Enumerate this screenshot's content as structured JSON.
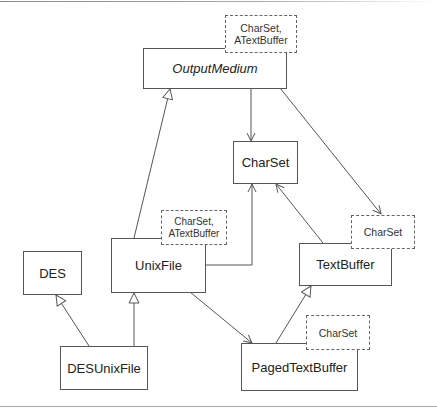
{
  "diagram": {
    "type": "UML class diagram",
    "classes": [
      {
        "id": "output_medium",
        "name": "OutputMedium",
        "abstract": true,
        "template_params": "CharSet,\nATextBuffer"
      },
      {
        "id": "charset",
        "name": "CharSet",
        "abstract": false
      },
      {
        "id": "unix_file",
        "name": "UnixFile",
        "abstract": false,
        "template_params": "CharSet,\nATextBuffer"
      },
      {
        "id": "text_buffer",
        "name": "TextBuffer",
        "abstract": false,
        "template_params": "CharSet"
      },
      {
        "id": "des",
        "name": "DES",
        "abstract": false
      },
      {
        "id": "des_unix_file",
        "name": "DESUnixFile",
        "abstract": false
      },
      {
        "id": "paged_text_buffer",
        "name": "PagedTextBuffer",
        "abstract": false,
        "template_params": "CharSet"
      }
    ],
    "relationships": [
      {
        "from": "UnixFile",
        "to": "OutputMedium",
        "kind": "generalization"
      },
      {
        "from": "OutputMedium",
        "to": "CharSet",
        "kind": "dependency"
      },
      {
        "from": "OutputMedium",
        "to": "TextBuffer",
        "kind": "dependency"
      },
      {
        "from": "UnixFile",
        "to": "CharSet",
        "kind": "dependency"
      },
      {
        "from": "TextBuffer",
        "to": "CharSet",
        "kind": "dependency"
      },
      {
        "from": "UnixFile",
        "to": "PagedTextBuffer",
        "kind": "dependency"
      },
      {
        "from": "DESUnixFile",
        "to": "DES",
        "kind": "generalization"
      },
      {
        "from": "DESUnixFile",
        "to": "UnixFile",
        "kind": "generalization"
      },
      {
        "from": "PagedTextBuffer",
        "to": "TextBuffer",
        "kind": "generalization"
      }
    ]
  }
}
